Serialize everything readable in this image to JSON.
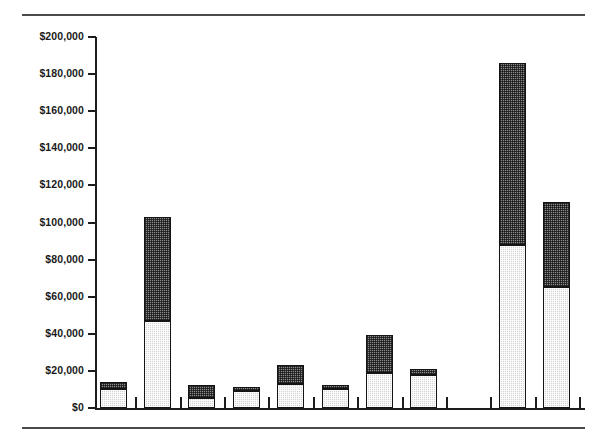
{
  "chart_data": {
    "type": "bar",
    "title": "",
    "subtitle": "",
    "xlabel": "",
    "ylabel": "",
    "stacked": true,
    "grid": false,
    "legend": "none",
    "ylim": [
      0,
      200000
    ],
    "ytick_labels": [
      "$200,000",
      "$180,000",
      "$160,000",
      "$140,000",
      "$120,000",
      "$100,000",
      "$80,000",
      "$60,000",
      "$40,000",
      "$20,000",
      "$0"
    ],
    "ytick_values": [
      200000,
      180000,
      160000,
      140000,
      120000,
      100000,
      80000,
      60000,
      40000,
      20000,
      0
    ],
    "categories": [
      "1",
      "2",
      "3",
      "4",
      "5",
      "6",
      "7",
      "8",
      "9",
      "10",
      "11"
    ],
    "xtick_labels": [
      "",
      "",
      "",
      "",
      "",
      "",
      "",
      "",
      "",
      "",
      ""
    ],
    "series": [
      {
        "name": "lower-segment",
        "fill": "light-checker",
        "values": [
          10000,
          47000,
          5500,
          9000,
          13000,
          10000,
          19000,
          18000,
          0,
          88000,
          65000
        ]
      },
      {
        "name": "upper-segment",
        "fill": "dark-checker",
        "values": [
          4000,
          56000,
          7000,
          2500,
          10000,
          2500,
          20500,
          3000,
          0,
          98000,
          46000
        ]
      }
    ],
    "totals": [
      14000,
      103000,
      12500,
      11500,
      23000,
      12500,
      39500,
      21000,
      0,
      186000,
      111000
    ]
  },
  "colors": {
    "axis": "#1d1d1d",
    "rule": "#4a4a4a",
    "bar_light": "#d3d3d3",
    "bar_dark": "#8a8a8a",
    "bar_outline": "#141414",
    "background": "#ffffff",
    "text": "#1a1a1a"
  }
}
